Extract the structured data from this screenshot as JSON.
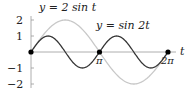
{
  "chart_data": {
    "type": "line",
    "title": "",
    "xlabel": "t",
    "ylabel": "",
    "xlim": [
      0,
      6.2832
    ],
    "ylim": [
      -2,
      2
    ],
    "grid": false,
    "x_ticks": [
      "π",
      "2π"
    ],
    "y_ticks": [
      "2",
      "1",
      "−1",
      "−2"
    ],
    "series": [
      {
        "name": "y = 2 sin t",
        "color": "#c8c8c8",
        "formula": "2*sin(t)",
        "x": [
          0,
          0.785,
          1.571,
          2.356,
          3.142,
          3.927,
          4.712,
          5.498,
          6.283
        ],
        "values": [
          0,
          1.414,
          2,
          1.414,
          0,
          -1.414,
          -2,
          -1.414,
          0
        ]
      },
      {
        "name": "y = sin 2t",
        "color": "#333333",
        "formula": "sin(2*t)",
        "x": [
          0,
          0.785,
          1.571,
          2.356,
          3.142,
          3.927,
          4.712,
          5.498,
          6.283
        ],
        "values": [
          0,
          1,
          0,
          -1,
          0,
          1,
          0,
          -1,
          0
        ]
      }
    ],
    "points": [
      {
        "t": 0,
        "y": 0
      },
      {
        "t": 3.1416,
        "y": 0
      },
      {
        "t": 6.2832,
        "y": 0
      }
    ],
    "annotations": [
      "y = 2 sin t",
      "y = sin 2t"
    ]
  },
  "labels": {
    "series1": "y = 2 sin t",
    "series2": "y = sin 2t",
    "axis_t": "t",
    "tick_pi": "π",
    "tick_2pi": "2π",
    "y2": "2",
    "y1": "1",
    "ym1": "−1",
    "ym2": "−2"
  }
}
